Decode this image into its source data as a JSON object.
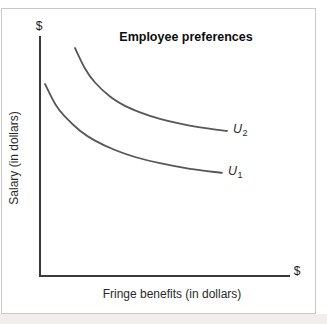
{
  "chart": {
    "title": "Employee preferences",
    "y_axis": {
      "end_symbol": "$",
      "label": "Salary (in dollars)"
    },
    "x_axis": {
      "end_symbol": "$",
      "label": "Fringe benefits (in dollars)"
    }
  },
  "chart_data": {
    "type": "line",
    "title": "Employee preferences",
    "xlabel": "Fringe benefits (in dollars)",
    "ylabel": "Salary (in dollars)",
    "x_axis_end_symbol": "$",
    "y_axis_end_symbol": "$",
    "axes_have_numeric_ticks": false,
    "grid": false,
    "units": "relative 0-100 (axes unlabeled, denominated in dollars)",
    "xlim": [
      0,
      100
    ],
    "ylim": [
      0,
      100
    ],
    "curve_color": "#57575a",
    "axis_color": "#3a3a3a",
    "legend_position": "labels at right end of each curve",
    "series": [
      {
        "name": "U2",
        "label_base": "U",
        "label_sub": "2",
        "description": "higher indifference curve (greater utility)",
        "points": [
          [
            14,
            95.0
          ],
          [
            18,
            86.5
          ],
          [
            22,
            80.7
          ],
          [
            28,
            74.9
          ],
          [
            34,
            71.0
          ],
          [
            40,
            68.3
          ],
          [
            48,
            65.6
          ],
          [
            56,
            63.6
          ],
          [
            64,
            62.1
          ],
          [
            74.8,
            60.6
          ]
        ]
      },
      {
        "name": "U1",
        "label_base": "U",
        "label_sub": "1",
        "description": "lower indifference curve (lesser utility)",
        "points": [
          [
            2,
            80.1
          ],
          [
            6,
            71.9
          ],
          [
            10,
            66.5
          ],
          [
            16,
            60.7
          ],
          [
            22,
            56.6
          ],
          [
            30,
            52.7
          ],
          [
            38,
            49.8
          ],
          [
            48,
            47.2
          ],
          [
            60,
            44.9
          ],
          [
            72.8,
            43.2
          ]
        ]
      }
    ]
  }
}
